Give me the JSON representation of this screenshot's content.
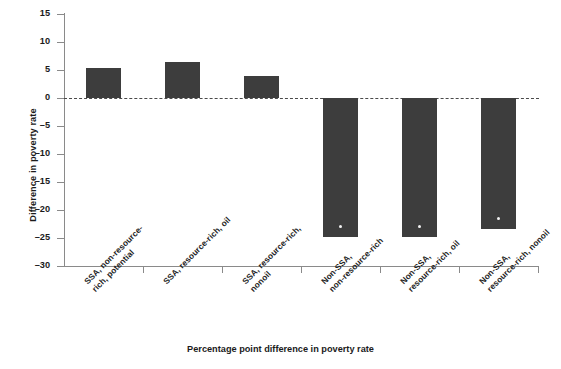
{
  "chart_data": {
    "type": "bar",
    "title": "",
    "subtitle": "",
    "xlabel": "Percentage point difference in poverty rate",
    "ylabel": "Difference in poverty rate",
    "categories": [
      "SSA, non-resource-rich, potential",
      "SSA, resource-rich, oil",
      "SSA, resource-rich, nonoil",
      "Non-SSA, non-resource-rich",
      "Non-SSA, resource-rich, oil",
      "Non-SSA, resource-rich, nonoil"
    ],
    "category_lines": [
      [
        "SSA, non-resource-",
        "rich, potential"
      ],
      [
        "SSA, resource-rich, oil"
      ],
      [
        "SSA, resource-rich,",
        "nonoil"
      ],
      [
        "Non-SSA,",
        "non-resource-rich"
      ],
      [
        "Non-SSA,",
        "resource-rich, oil"
      ],
      [
        "Non-SSA,",
        "resource-rich, nonoil"
      ]
    ],
    "values": [
      5.3,
      6.4,
      4.0,
      -24.8,
      -24.8,
      -23.4
    ],
    "ylim": [
      -30,
      15
    ],
    "yticks": [
      15,
      10,
      5,
      0,
      -5,
      -10,
      -15,
      -20,
      -25,
      -30
    ],
    "ytick_labels": [
      "15",
      "10",
      "5",
      "0",
      "–5",
      "–10",
      "–15",
      "–20",
      "–25",
      "–30"
    ],
    "grid": false,
    "legend": "none",
    "zero_reference_line": true,
    "bar_color": "#3d3d3d",
    "axis_color": "#8a8a8a",
    "zero_line_color": "#4a4a4a",
    "marker_color": "#f2f2f2",
    "markers": [
      false,
      false,
      false,
      true,
      true,
      true
    ]
  }
}
